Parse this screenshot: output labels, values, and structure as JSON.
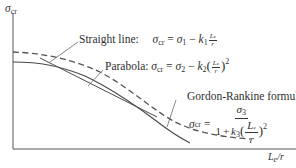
{
  "figure": {
    "type": "column-buckling-curves",
    "y_axis": {
      "label_symbol": "σ",
      "label_sub": "cr"
    },
    "x_axis": {
      "label_L": "L",
      "label_sub": "e",
      "label_rest": "/r"
    },
    "curves": [
      {
        "name": "Straight line",
        "style": "solid",
        "color": "#4a4a4a"
      },
      {
        "name": "Parabola",
        "style": "solid",
        "color": "#4a4a4a"
      },
      {
        "name": "Gordon-Rankine formula",
        "style": "dashed",
        "color": "#5a5a5a"
      }
    ]
  },
  "labels": {
    "straight_line": {
      "title": "Straight line:",
      "lhs_sym": "σ",
      "lhs_sub": "cr",
      "eq": "=",
      "s1_sym": "σ",
      "s1_sub": "1",
      "minus": "−",
      "k_sym": "k",
      "k_sub": "1",
      "frac_num": "L",
      "frac_num_sub": "e",
      "frac_den": "r"
    },
    "parabola": {
      "title": "Parabola:",
      "lhs_sym": "σ",
      "lhs_sub": "cr",
      "eq": "=",
      "s2_sym": "σ",
      "s2_sub": "2",
      "minus": "−",
      "k_sym": "k",
      "k_sub": "2",
      "lparen": "(",
      "rparen": ")",
      "frac_num": "L",
      "frac_num_sub": "e",
      "frac_den": "r",
      "power": "2"
    },
    "gordon_rankine": {
      "title": "Gordon-Rankine formula:",
      "lhs_sym": "σ",
      "lhs_sub": "cr",
      "eq": "=",
      "num_sym": "σ",
      "num_sub": "3",
      "den_one": "1",
      "plus": "+",
      "k_sym": "k",
      "k_sub": "3",
      "lparen": "(",
      "rparen": ")",
      "frac_num": "L",
      "frac_num_sub": "e",
      "frac_den": "r",
      "power": "2"
    }
  }
}
